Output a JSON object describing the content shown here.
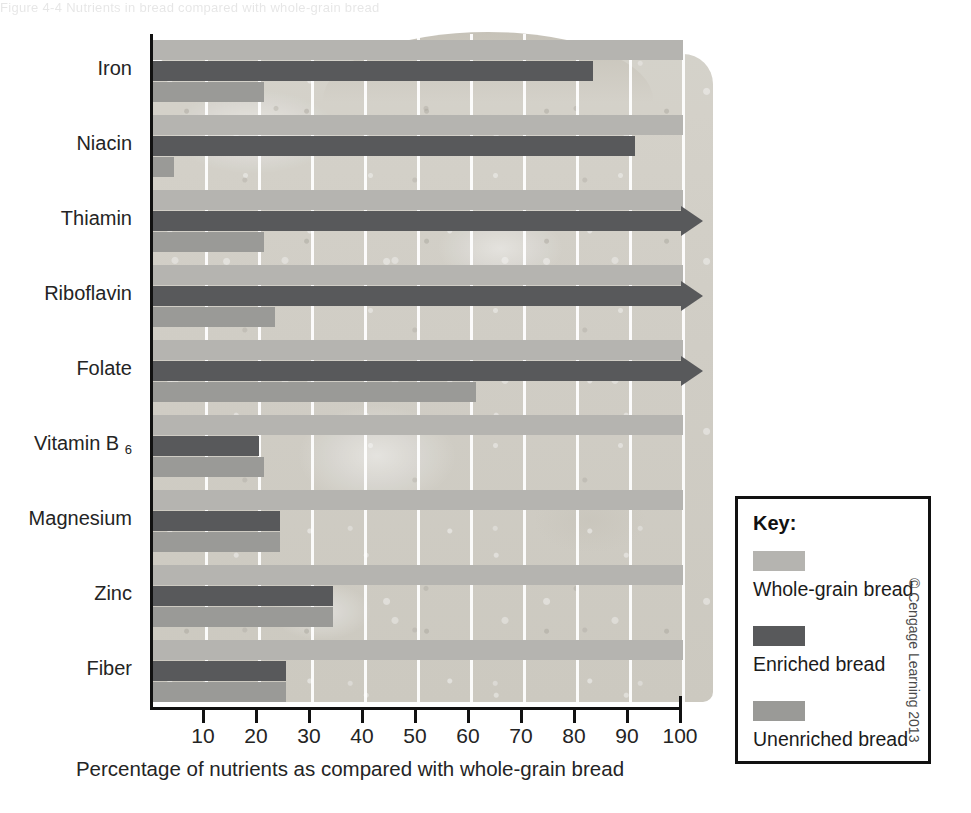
{
  "figure": {
    "top_partial_text": "Figure 4-4  Nutrients in bread compared with whole-grain bread",
    "credit": "© Cengage Learning 2013"
  },
  "chart_data": {
    "type": "bar",
    "orientation": "horizontal",
    "title": "",
    "xlabel": "Percentage of nutrients as compared with whole-grain bread",
    "ylabel": "",
    "xlim": [
      0,
      100
    ],
    "xticks": [
      10,
      20,
      30,
      40,
      50,
      60,
      70,
      80,
      90,
      100
    ],
    "grid": "vertical",
    "legend_position": "right",
    "categories": [
      "Iron",
      "Niacin",
      "Thiamin",
      "Riboflavin",
      "Folate",
      "Vitamin B6",
      "Magnesium",
      "Zinc",
      "Fiber"
    ],
    "series": [
      {
        "name": "Whole-grain bread",
        "color": "#b5b4b0",
        "values": [
          100,
          100,
          100,
          100,
          100,
          100,
          100,
          100,
          100
        ],
        "overflow": [
          false,
          false,
          false,
          false,
          false,
          false,
          false,
          false,
          false
        ]
      },
      {
        "name": "Enriched bread",
        "color": "#58595b",
        "values": [
          83,
          91,
          100,
          100,
          100,
          20,
          24,
          34,
          25
        ],
        "overflow": [
          false,
          false,
          true,
          true,
          true,
          false,
          false,
          false,
          false
        ]
      },
      {
        "name": "Unenriched bread",
        "color": "#9a9a97",
        "values": [
          21,
          4,
          21,
          23,
          61,
          21,
          24,
          34,
          25
        ],
        "overflow": [
          false,
          false,
          false,
          false,
          false,
          false,
          false,
          false,
          false
        ]
      }
    ]
  },
  "legend": {
    "title": "Key:",
    "items": [
      {
        "label": "Whole-grain bread",
        "swatch": "whole"
      },
      {
        "label": "Enriched bread",
        "swatch": "enriched"
      },
      {
        "label": "Unenriched bread",
        "swatch": "unenriched"
      }
    ]
  },
  "axis_labels": {
    "x_title": "Percentage of nutrients as compared with whole-grain bread",
    "category_labels": [
      "Iron",
      "Niacin",
      "Thiamin",
      "Riboflavin",
      "Folate",
      "Vitamin B",
      "Magnesium",
      "Zinc",
      "Fiber"
    ],
    "vitamin_b6_subscript": "6"
  }
}
